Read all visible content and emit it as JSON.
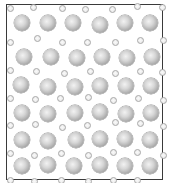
{
  "figure": {
    "frame": {
      "left": 6,
      "top": 4,
      "width": 157,
      "height": 176,
      "color": "#3a3a3a"
    },
    "large_diameter": 16,
    "small_diameter": 7,
    "large_spheres": [
      [
        22,
        23
      ],
      [
        48,
        23
      ],
      [
        73,
        23
      ],
      [
        100,
        25
      ],
      [
        125,
        23
      ],
      [
        150,
        23
      ],
      [
        24,
        57
      ],
      [
        51,
        57
      ],
      [
        77,
        58
      ],
      [
        102,
        57
      ],
      [
        127,
        58
      ],
      [
        152,
        57
      ],
      [
        21,
        85
      ],
      [
        48,
        87
      ],
      [
        75,
        87
      ],
      [
        100,
        86
      ],
      [
        126,
        86
      ],
      [
        151,
        86
      ],
      [
        22,
        113
      ],
      [
        48,
        114
      ],
      [
        75,
        113
      ],
      [
        100,
        112
      ],
      [
        126,
        114
      ],
      [
        151,
        113
      ],
      [
        22,
        140
      ],
      [
        48,
        141
      ],
      [
        76,
        140
      ],
      [
        100,
        139
      ],
      [
        125,
        139
      ],
      [
        150,
        140
      ],
      [
        22,
        166
      ],
      [
        48,
        165
      ],
      [
        74,
        166
      ],
      [
        100,
        165
      ],
      [
        125,
        166
      ],
      [
        150,
        166
      ]
    ],
    "small_spheres": [
      [
        10,
        8
      ],
      [
        33,
        7
      ],
      [
        62,
        8
      ],
      [
        85,
        9
      ],
      [
        112,
        9
      ],
      [
        137,
        6
      ],
      [
        162,
        7
      ],
      [
        10,
        42
      ],
      [
        37,
        38
      ],
      [
        62,
        42
      ],
      [
        87,
        42
      ],
      [
        115,
        42
      ],
      [
        140,
        40
      ],
      [
        163,
        40
      ],
      [
        10,
        70
      ],
      [
        36,
        71
      ],
      [
        64,
        73
      ],
      [
        90,
        71
      ],
      [
        115,
        73
      ],
      [
        140,
        71
      ],
      [
        162,
        72
      ],
      [
        10,
        98
      ],
      [
        35,
        99
      ],
      [
        60,
        98
      ],
      [
        88,
        97
      ],
      [
        113,
        100
      ],
      [
        138,
        98
      ],
      [
        163,
        100
      ],
      [
        10,
        125
      ],
      [
        35,
        124
      ],
      [
        62,
        127
      ],
      [
        87,
        125
      ],
      [
        115,
        122
      ],
      [
        140,
        123
      ],
      [
        163,
        126
      ],
      [
        10,
        153
      ],
      [
        34,
        155
      ],
      [
        61,
        153
      ],
      [
        88,
        155
      ],
      [
        113,
        152
      ],
      [
        137,
        152
      ],
      [
        163,
        155
      ],
      [
        10,
        180
      ],
      [
        34,
        181
      ],
      [
        61,
        180
      ],
      [
        88,
        181
      ],
      [
        113,
        180
      ],
      [
        137,
        180
      ]
    ]
  }
}
